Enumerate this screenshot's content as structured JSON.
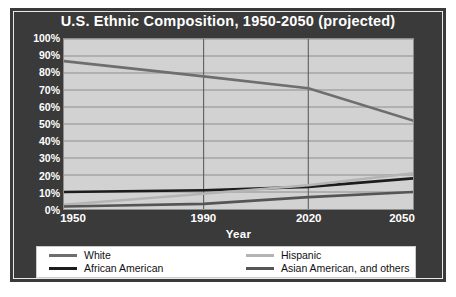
{
  "chart_title": "U.S. Ethnic Composition, 1950-2050 (projected)",
  "axis": {
    "xlabel": "Year",
    "ylabel": "",
    "yticks": [
      "100%",
      "90%",
      "80%",
      "70%",
      "60%",
      "50%",
      "40%",
      "30%",
      "20%",
      "10%",
      "0%"
    ],
    "xticks": [
      "1950",
      "1990",
      "2020",
      "2050"
    ]
  },
  "legend": {
    "entries": [
      {
        "label": "White",
        "color": "#6e6e6e"
      },
      {
        "label": "African American",
        "color": "#1c1c1c"
      },
      {
        "label": "Hispanic",
        "color": "#b4b4b4"
      },
      {
        "label": "Asian American, and others",
        "color": "#555555"
      }
    ]
  },
  "colors": {
    "panel_background": "#3a3a3a",
    "plot_background": "#d2d2d2",
    "gridline": "#8e8e8e",
    "axis_text": "#ffffff",
    "legend_background": "#ffffff",
    "legend_text": "#111111"
  },
  "chart_data": {
    "type": "line",
    "title": "U.S. Ethnic Composition, 1950-2050 (projected)",
    "xlabel": "Year",
    "ylabel": "",
    "x": [
      1950,
      1990,
      2020,
      2050
    ],
    "xlim": [
      1950,
      2050
    ],
    "ylim": [
      0,
      100
    ],
    "ytick_values": [
      0,
      10,
      20,
      30,
      40,
      50,
      60,
      70,
      80,
      90,
      100
    ],
    "grid": "horizontal-and-vertical",
    "legend_position": "bottom",
    "units": "percent",
    "series": [
      {
        "name": "White",
        "color": "#6e6e6e",
        "values": [
          87,
          78,
          71,
          52
        ]
      },
      {
        "name": "African American",
        "color": "#1c1c1c",
        "values": [
          10,
          11,
          13,
          18
        ]
      },
      {
        "name": "Hispanic",
        "color": "#b4b4b4",
        "values": [
          2.5,
          9,
          14,
          21
        ]
      },
      {
        "name": "Asian American, and others",
        "color": "#555555",
        "values": [
          1.5,
          3,
          7,
          10
        ]
      }
    ]
  }
}
